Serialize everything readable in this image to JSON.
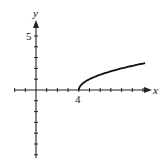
{
  "chart_data": {
    "type": "line",
    "title": "",
    "xlabel": "x",
    "ylabel": "y",
    "function": "y = sqrt(x - 4)",
    "x": [
      4,
      4.25,
      4.5,
      5,
      5.5,
      6,
      7,
      8,
      9,
      10,
      10.2
    ],
    "series": [
      {
        "name": "y = sqrt(x - 4)",
        "values": [
          0,
          0.5,
          0.71,
          1,
          1.22,
          1.41,
          1.73,
          2,
          2.24,
          2.45,
          2.49
        ]
      }
    ],
    "xlim": [
      -3,
      11
    ],
    "ylim": [
      -8,
      7
    ],
    "x_tick_labels": [
      {
        "value": 4,
        "label": "4"
      }
    ],
    "y_tick_labels": [
      {
        "value": 5,
        "label": "5"
      }
    ],
    "grid": false,
    "legend": "none"
  },
  "axes": {
    "x_label": "x",
    "y_label": "y",
    "x_tick_label": "4",
    "y_tick_label": "5"
  }
}
